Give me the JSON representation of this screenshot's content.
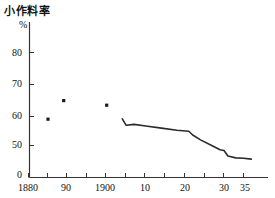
{
  "chart_data": {
    "type": "line",
    "title": "小作料率",
    "ylabel": "%",
    "xlabel": "",
    "ylim": [
      0,
      85
    ],
    "y_axis_broken": true,
    "yticks": [
      {
        "label": "0",
        "value": 0
      },
      {
        "label": "50",
        "value": 50
      },
      {
        "label": "60",
        "value": 60
      },
      {
        "label": "70",
        "value": 70
      },
      {
        "label": "80",
        "value": 80
      }
    ],
    "xlim": [
      1880,
      1938
    ],
    "xticks_labeled": [
      {
        "label": "1880",
        "value": 1880
      },
      {
        "label": "90",
        "value": 1890
      },
      {
        "label": "1900",
        "value": 1900
      },
      {
        "label": "10",
        "value": 1910
      },
      {
        "label": "20",
        "value": 1920
      },
      {
        "label": "30",
        "value": 1930
      },
      {
        "label": "35",
        "value": 1935
      }
    ],
    "xticks_minor": [
      1885,
      1895,
      1905,
      1915,
      1925
    ],
    "grid": false,
    "legend": null,
    "series": [
      {
        "name": "scatter-points",
        "type": "scatter",
        "points": [
          {
            "x": 1885,
            "y": 58.5
          },
          {
            "x": 1889,
            "y": 64.5
          },
          {
            "x": 1900,
            "y": 63.0
          }
        ]
      },
      {
        "name": "tenancy-rate-line",
        "type": "line",
        "points": [
          {
            "x": 1904,
            "y": 58.6
          },
          {
            "x": 1905,
            "y": 56.5
          },
          {
            "x": 1907,
            "y": 56.8
          },
          {
            "x": 1910,
            "y": 56.3
          },
          {
            "x": 1914,
            "y": 55.6
          },
          {
            "x": 1918,
            "y": 54.9
          },
          {
            "x": 1921,
            "y": 54.6
          },
          {
            "x": 1922,
            "y": 53.4
          },
          {
            "x": 1924,
            "y": 51.8
          },
          {
            "x": 1927,
            "y": 49.9
          },
          {
            "x": 1929,
            "y": 48.6
          },
          {
            "x": 1930,
            "y": 48.4
          },
          {
            "x": 1931,
            "y": 46.6
          },
          {
            "x": 1933,
            "y": 46.0
          },
          {
            "x": 1935,
            "y": 45.9
          },
          {
            "x": 1937,
            "y": 45.6
          }
        ]
      }
    ]
  },
  "axis_labels": {
    "y": [
      "80",
      "70",
      "60",
      "50",
      "0"
    ],
    "x": [
      "1880",
      "90",
      "1900",
      "10",
      "20",
      "30",
      "35"
    ]
  }
}
